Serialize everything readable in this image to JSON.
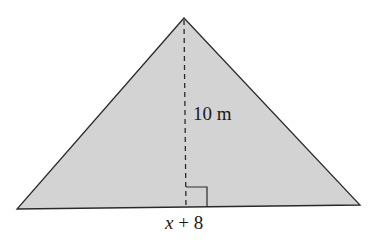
{
  "diagram": {
    "shape": "triangle",
    "fill_color": "#d3d3d3",
    "stroke_color": "#2a2a2a",
    "vertices": {
      "apex": [
        184,
        18
      ],
      "left": [
        17,
        209
      ],
      "right": [
        360,
        205
      ]
    },
    "altitude": {
      "style": "dashed",
      "from": [
        184,
        18
      ],
      "to": [
        186,
        208
      ],
      "label": "10 m"
    },
    "right_angle_marker": true,
    "base": {
      "label_var": "x",
      "label_rest": " + 8"
    }
  }
}
